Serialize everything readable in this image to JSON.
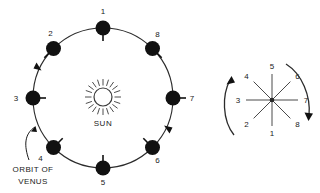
{
  "figure": {
    "background_color": "#ffffff",
    "line_color": "#2b2b2b",
    "body_color": "#111111"
  },
  "orbit_diagram": {
    "center": {
      "x": 103,
      "y": 98
    },
    "radius": 70,
    "direction_hint": "arrowheads on orbit path",
    "sun": {
      "label": "SUN",
      "cx": 103,
      "cy": 97,
      "disc_radius": 9,
      "ray_count": 20
    },
    "caption": {
      "line1": "ORBIT OF",
      "line2": "VENUS"
    },
    "positions": [
      {
        "id": "1",
        "label": "1",
        "angle_deg": 90,
        "label_dx": 0,
        "label_dy": -14,
        "stick_dir": "in",
        "stick_len": 13
      },
      {
        "id": "2",
        "label": "2",
        "angle_deg": 135,
        "label_dx": -3,
        "label_dy": -13,
        "stick_dir": "out",
        "stick_len": 13
      },
      {
        "id": "3",
        "label": "3",
        "angle_deg": 180,
        "label_dx": -17,
        "label_dy": 3,
        "stick_dir": "in",
        "stick_len": 13
      },
      {
        "id": "4",
        "label": "4",
        "angle_deg": 225,
        "label_dx": -13,
        "label_dy": 13,
        "stick_dir": "in",
        "stick_len": 13
      },
      {
        "id": "5",
        "label": "5",
        "angle_deg": 270,
        "label_dx": 0,
        "label_dy": 17,
        "stick_dir": "in",
        "stick_len": 13
      },
      {
        "id": "6",
        "label": "6",
        "angle_deg": 315,
        "label_dx": 5,
        "label_dy": 15,
        "stick_dir": "in",
        "stick_len": 13
      },
      {
        "id": "7",
        "label": "7",
        "angle_deg": 0,
        "label_dx": 17,
        "label_dy": 3,
        "stick_dir": "out",
        "stick_len": 13
      },
      {
        "id": "8",
        "label": "8",
        "angle_deg": 45,
        "label_dx": 5,
        "label_dy": -12,
        "stick_dir": "out",
        "stick_len": 13
      }
    ]
  },
  "phase_diagram": {
    "center": {
      "x": 272,
      "y": 100
    },
    "ray_length": 26,
    "rays": [
      {
        "id": "1",
        "label": "1",
        "angle_deg": 270,
        "label_dx": 0,
        "label_dy": 12
      },
      {
        "id": "2",
        "label": "2",
        "angle_deg": 225,
        "label_dx": -9,
        "label_dy": 9
      },
      {
        "id": "3",
        "label": "3",
        "angle_deg": 180,
        "label_dx": -12,
        "label_dy": 3
      },
      {
        "id": "4",
        "label": "4",
        "angle_deg": 135,
        "label_dx": -9,
        "label_dy": -7
      },
      {
        "id": "5",
        "label": "5",
        "angle_deg": 90,
        "label_dx": 0,
        "label_dy": -10
      },
      {
        "id": "6",
        "label": "6",
        "angle_deg": 45,
        "label_dx": 9,
        "label_dy": -7
      },
      {
        "id": "7",
        "label": "7",
        "angle_deg": 0,
        "label_dx": 12,
        "label_dy": 3
      },
      {
        "id": "8",
        "label": "8",
        "angle_deg": 315,
        "label_dx": 9,
        "label_dy": 9
      }
    ],
    "rotation_arrows": {
      "left": "arc-arrow-up",
      "right": "arc-arrow-down"
    }
  }
}
